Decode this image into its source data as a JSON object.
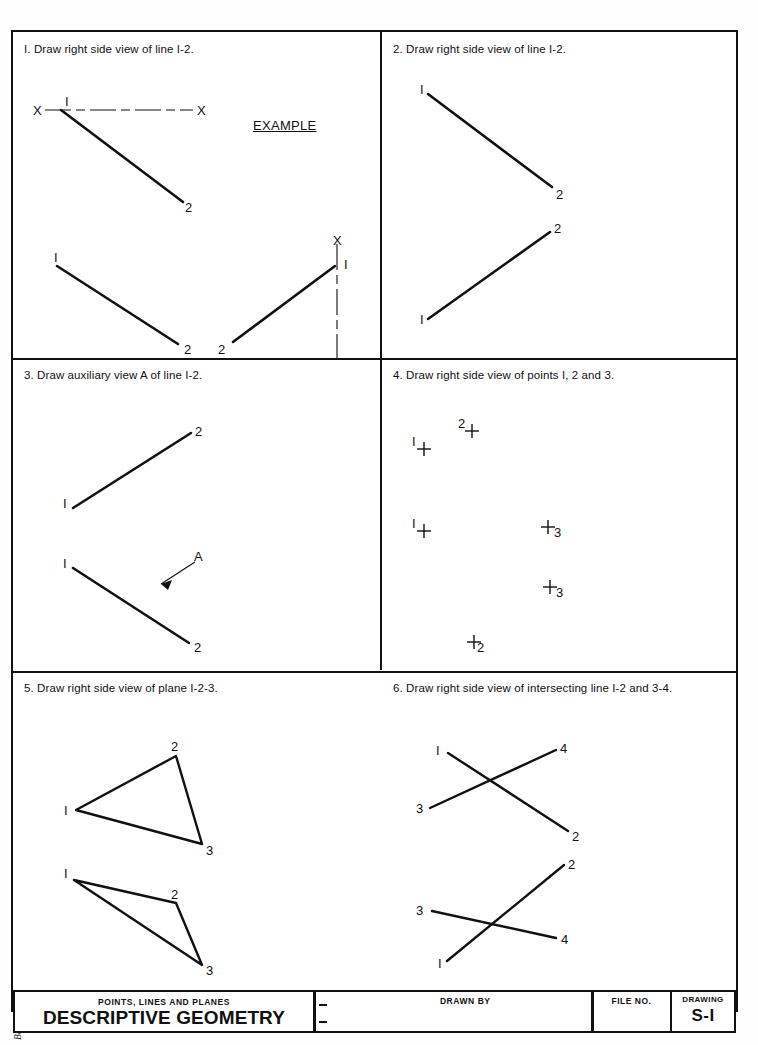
{
  "document": {
    "margin_credits": [
      "Copyright © by Glencoe/McGraw-Hill.",
      "Basic Technical Drawing Student Workbook"
    ]
  },
  "panels": [
    {
      "number": "1.",
      "prompt": "I.  Draw right side view of line I-2.",
      "example_label": "EXAMPLE",
      "labels": [
        "X",
        "I",
        "X",
        "2",
        "I",
        "2",
        "X",
        "I",
        "2",
        "X"
      ]
    },
    {
      "number": "2.",
      "prompt": "2.  Draw right side view of line I-2.",
      "labels": [
        "I",
        "2",
        "2",
        "I"
      ]
    },
    {
      "number": "3.",
      "prompt": "3.  Draw auxiliary view A of line I-2.",
      "labels": [
        "2",
        "I",
        "I",
        "A",
        "2"
      ]
    },
    {
      "number": "4.",
      "prompt": "4.  Draw right side view of points I, 2 and 3.",
      "points": [
        {
          "label": "2",
          "side": "left"
        },
        {
          "label": "I",
          "side": "left"
        },
        {
          "label": "3",
          "side": "right"
        },
        {
          "label": "I",
          "side": "left"
        },
        {
          "label": "3",
          "side": "right"
        },
        {
          "label": "2",
          "side": "right"
        }
      ]
    },
    {
      "number": "5.",
      "prompt": "5.  Draw right side view of plane I-2-3.",
      "labels": [
        "2",
        "I",
        "3",
        "I",
        "2",
        "3"
      ]
    },
    {
      "number": "6.",
      "prompt": "6.  Draw right side view of intersecting line I-2 and 3-4.",
      "labels": [
        "I",
        "4",
        "3",
        "2",
        "2",
        "3",
        "4",
        "I"
      ]
    }
  ],
  "title_block": {
    "subtitle": "POINTS, LINES AND PLANES",
    "title": "DESCRIPTIVE GEOMETRY",
    "drawn_by_label": "DRAWN BY",
    "file_no_label": "FILE NO.",
    "drawing_label": "DRAWING",
    "drawing_value": "S-I"
  },
  "colors": {
    "ink": "#111111",
    "paper": "#ffffff"
  }
}
